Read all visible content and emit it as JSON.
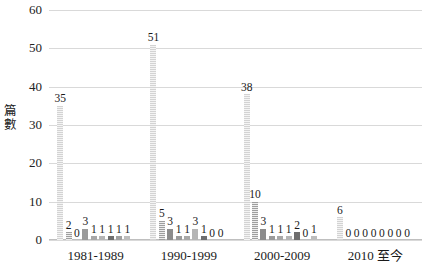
{
  "chart_data": {
    "type": "bar",
    "title": "",
    "xlabel": "",
    "ylabel": "篇數",
    "ylim": [
      0,
      60
    ],
    "ytick_labels": [
      "0",
      "10",
      "20",
      "30",
      "40",
      "50",
      "60"
    ],
    "grid": true,
    "legend": "none",
    "categories": [
      "1981-1989",
      "1990-1999",
      "2000-2009",
      "2010 至今"
    ],
    "series": [
      {
        "name": "1",
        "values": [
          35,
          51,
          38,
          6
        ]
      },
      {
        "name": "2",
        "values": [
          2,
          5,
          10,
          0
        ]
      },
      {
        "name": "3",
        "values": [
          0,
          3,
          3,
          0
        ]
      },
      {
        "name": "4",
        "values": [
          3,
          1,
          1,
          0
        ]
      },
      {
        "name": "5",
        "values": [
          1,
          1,
          1,
          0
        ]
      },
      {
        "name": "6",
        "values": [
          1,
          3,
          1,
          0
        ]
      },
      {
        "name": "7",
        "values": [
          1,
          1,
          2,
          0
        ]
      },
      {
        "name": "8",
        "values": [
          1,
          0,
          0,
          0
        ]
      },
      {
        "name": "9",
        "values": [
          1,
          0,
          1,
          0
        ]
      }
    ],
    "group_values": [
      [
        35,
        2,
        0,
        3,
        1,
        1,
        1,
        1,
        1
      ],
      [
        51,
        5,
        3,
        1,
        1,
        3,
        1,
        0,
        0
      ],
      [
        38,
        10,
        3,
        1,
        1,
        1,
        2,
        0,
        1
      ],
      [
        6,
        0,
        0,
        0,
        0,
        0,
        0,
        0,
        0
      ]
    ],
    "colors": {
      "gridline": "#d9d9d9",
      "axis": "#bfbfbf",
      "text": "#1a1a1a",
      "series": [
        "#e3e3e3",
        "#b0b0b0",
        "#8c8c8c",
        "#9b9b9b",
        "#a8a8a8",
        "#b5b5b5",
        "#6e6e6e",
        "#a0a0a0",
        "#bdbdbd"
      ]
    }
  }
}
